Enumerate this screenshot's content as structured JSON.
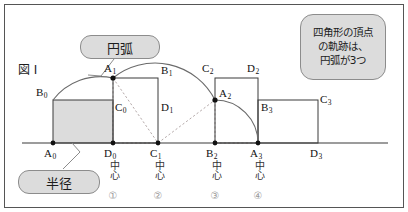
{
  "figure": {
    "label": "図 I",
    "baseline_y": 143
  },
  "callouts": [
    {
      "name": "arc",
      "text": "円弧",
      "x": 80,
      "y": 35,
      "w": 80,
      "h": 24,
      "font": 13
    },
    {
      "name": "radius",
      "text": "半径",
      "x": 18,
      "y": 170,
      "w": 82,
      "h": 24,
      "font": 13
    },
    {
      "name": "locus",
      "lines": [
        "四角形の頂点",
        "の軌跡は、",
        "円弧が3つ"
      ],
      "x": 300,
      "y": 14,
      "w": 86,
      "h": 66,
      "font": 10.5
    }
  ],
  "vertex_labels": [
    {
      "id": "A0",
      "base": "A",
      "sub": "0",
      "x": 44,
      "y": 148
    },
    {
      "id": "B0",
      "base": "B",
      "sub": "0",
      "x": 36,
      "y": 87
    },
    {
      "id": "C0",
      "base": "C",
      "sub": "0",
      "x": 115,
      "y": 102
    },
    {
      "id": "D0",
      "base": "D",
      "sub": "0",
      "x": 104,
      "y": 148
    },
    {
      "id": "A1",
      "base": "A",
      "sub": "1",
      "x": 104,
      "y": 63
    },
    {
      "id": "B1",
      "base": "B",
      "sub": "1",
      "x": 161,
      "y": 65
    },
    {
      "id": "C1",
      "base": "C",
      "sub": "1",
      "x": 150,
      "y": 148
    },
    {
      "id": "D1",
      "base": "D",
      "sub": "1",
      "x": 161,
      "y": 102
    },
    {
      "id": "A2",
      "base": "A",
      "sub": "2",
      "x": 219,
      "y": 88
    },
    {
      "id": "B2",
      "base": "B",
      "sub": "2",
      "x": 206,
      "y": 148
    },
    {
      "id": "C2",
      "base": "C",
      "sub": "2",
      "x": 202,
      "y": 63
    },
    {
      "id": "D2",
      "base": "D",
      "sub": "2",
      "x": 247,
      "y": 63
    },
    {
      "id": "A3",
      "base": "A",
      "sub": "3",
      "x": 250,
      "y": 148
    },
    {
      "id": "B3",
      "base": "B",
      "sub": "3",
      "x": 261,
      "y": 102
    },
    {
      "id": "C3",
      "base": "C",
      "sub": "3",
      "x": 320,
      "y": 94
    },
    {
      "id": "D3",
      "base": "D",
      "sub": "3",
      "x": 310,
      "y": 148
    }
  ],
  "centers": [
    {
      "point": "D0",
      "word": "中心",
      "num": "①",
      "x": 113
    },
    {
      "point": "C1",
      "word": "中心",
      "num": "②",
      "x": 158
    },
    {
      "point": "B2",
      "word": "中心",
      "num": "③",
      "x": 215
    },
    {
      "point": "A3",
      "word": "中心",
      "num": "④",
      "x": 258
    }
  ],
  "geometry": {
    "baseline": {
      "x1": 22,
      "x2": 388,
      "y": 143
    },
    "x": {
      "A0": 53,
      "D0": 113,
      "C1": 158,
      "B2": 215,
      "A3": 258,
      "D3": 318
    },
    "y": {
      "ground": 143,
      "mid": 100,
      "top": 78
    },
    "rect_fill": "#dcdcdc",
    "stroke": "#3b3b3b",
    "arc_stroke": "#6a6a6a",
    "dash_stroke": "#b0a8a8",
    "dot": "#111111",
    "frame": "#555555"
  },
  "shapes": {
    "filled_rect": {
      "name": "rect-A0B0C0D0",
      "x": 53,
      "y": 100,
      "w": 60,
      "h": 43
    },
    "rect2": {
      "name": "rect-A1B1C1D1",
      "x": 113,
      "y": 78,
      "w": 45,
      "h": 65
    },
    "rect3": {
      "name": "rect-C2D2A3B2",
      "x": 215,
      "y": 78,
      "w": 43,
      "h": 65
    },
    "rect4": {
      "name": "rect-A3B3C3D3",
      "x": 258,
      "y": 100,
      "w": 60,
      "h": 43
    }
  },
  "arcs": [
    {
      "name": "arc-1-A0-to-A1",
      "d": "M 53 100 A 60 60 0 0 1 113 78"
    },
    {
      "name": "arc-2-A1-to-A2",
      "d": "M 113 78 A 65 65 0 0 1 215 100"
    },
    {
      "name": "arc-3-A2-to-A3",
      "d": "M 215 100 A 43 43 0 0 1 258 143"
    }
  ],
  "dashes": [
    {
      "name": "dash-D0-to-C1",
      "x1": 113,
      "y1": 78,
      "x2": 158,
      "y2": 143
    },
    {
      "name": "dash-A1-to-C1",
      "x1": 113,
      "y1": 143,
      "x2": 158,
      "y2": 143
    },
    {
      "name": "dash-C1-to-A2",
      "x1": 158,
      "y1": 143,
      "x2": 215,
      "y2": 100
    },
    {
      "name": "dash-B2-to-A3",
      "x1": 215,
      "y1": 143,
      "x2": 258,
      "y2": 143
    },
    {
      "name": "dash-A2-vertical",
      "x1": 215,
      "y1": 100,
      "x2": 215,
      "y2": 143
    }
  ],
  "leaders": [
    {
      "name": "leader-arc",
      "d": "M 112 58 L 100 75 L 88 74"
    },
    {
      "name": "leader-radius",
      "d": "M 65 168 L 78 152 L 72 143"
    }
  ],
  "border": {
    "x": 4,
    "y": 4,
    "w": 400,
    "h": 204,
    "color": "#555555"
  }
}
